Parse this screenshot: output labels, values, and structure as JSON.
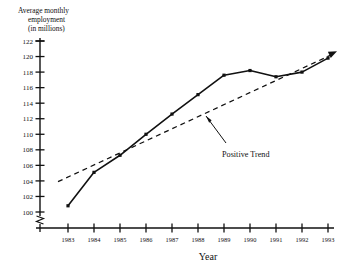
{
  "chart_data": {
    "type": "line",
    "title": "",
    "ylabel_lines": [
      "Average monthly",
      "employment",
      "(in millions)"
    ],
    "ylabel": "Average monthly employment (in millions)",
    "xlabel": "Year",
    "categories": [
      "1983",
      "1984",
      "1985",
      "1986",
      "1987",
      "1988",
      "1989",
      "1990",
      "1991",
      "1992",
      "1993"
    ],
    "x": [
      1983,
      1984,
      1985,
      1986,
      1987,
      1988,
      1989,
      1990,
      1991,
      1992,
      1993
    ],
    "series": [
      {
        "name": "Average monthly employment",
        "style": "solid-with-markers",
        "values": [
          100.8,
          105.1,
          107.3,
          110.0,
          112.6,
          115.1,
          117.6,
          118.2,
          117.4,
          118.0,
          119.8
        ]
      },
      {
        "name": "Positive Trend",
        "style": "dashed-with-arrow",
        "values": [
          103.9,
          105.5,
          107.1,
          108.7,
          110.3,
          111.9,
          113.5,
          115.1,
          116.7,
          118.3,
          119.9
        ]
      }
    ],
    "ylim": [
      100,
      122
    ],
    "yticks": [
      100,
      102,
      104,
      106,
      108,
      110,
      112,
      114,
      116,
      118,
      120,
      122
    ],
    "ytick_labels": [
      "100",
      "102",
      "104",
      "106",
      "108",
      "110",
      "112",
      "114",
      "116",
      "118",
      "120",
      "122"
    ],
    "xlim": [
      1982.6,
      1993.4
    ],
    "xticks": [
      1983,
      1984,
      1985,
      1986,
      1987,
      1988,
      1989,
      1990,
      1991,
      1992,
      1993
    ],
    "axis_break": true,
    "axis_break_note": "zigzag break on y-axis below 100",
    "grid": false,
    "legend": "none",
    "annotations": [
      {
        "text": "Positive Trend",
        "points_to_series": "Positive Trend",
        "arrow": true
      }
    ],
    "colors": {
      "axis": "#111111",
      "data_line": "#111111",
      "trend_line": "#111111",
      "background": "#ffffff"
    }
  }
}
